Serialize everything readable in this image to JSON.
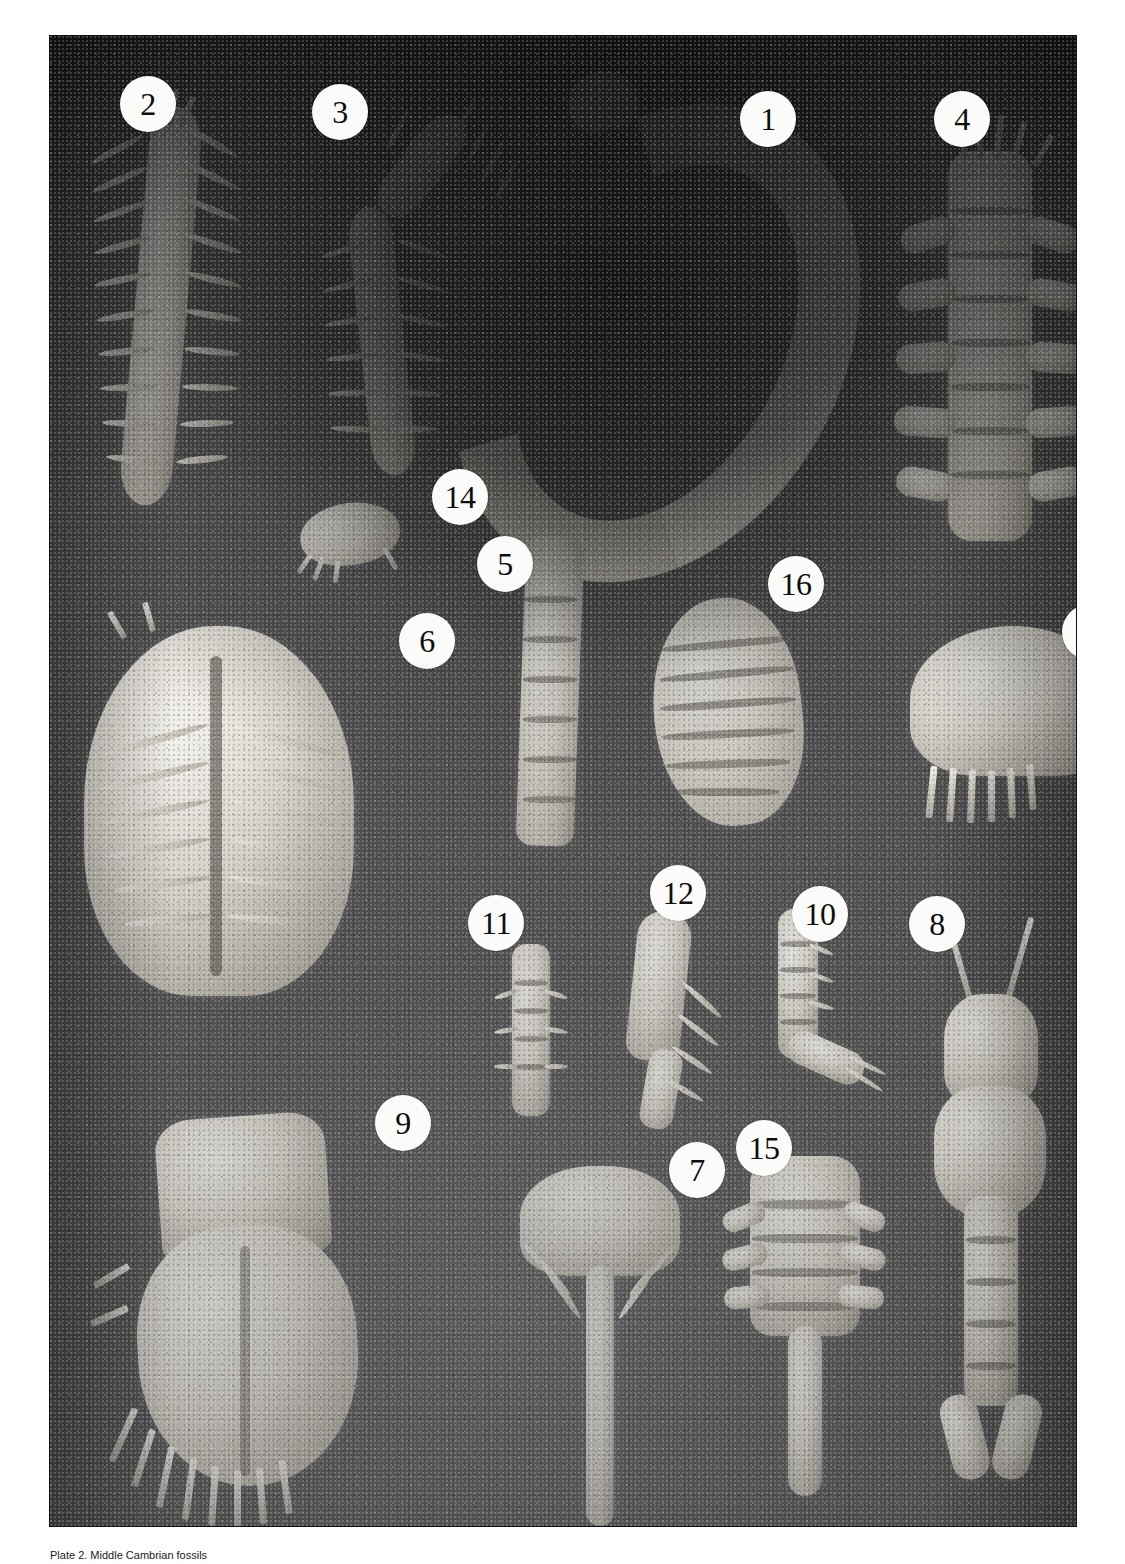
{
  "plate": {
    "title": "Middle Cambrian Burgess Shale fossil plate",
    "background_color": "#4f4f4f",
    "dark_field_color": "#1c1c1c",
    "callout_fill": "#fbfbf9",
    "callout_text_color": "#0d0d0d",
    "callouts": [
      {
        "id": "callout-2",
        "label": "2",
        "x": 70,
        "y": 40
      },
      {
        "id": "callout-3",
        "label": "3",
        "x": 262,
        "y": 48
      },
      {
        "id": "callout-1",
        "label": "1",
        "x": 690,
        "y": 55
      },
      {
        "id": "callout-4",
        "label": "4",
        "x": 884,
        "y": 55
      },
      {
        "id": "callout-14",
        "label": "14",
        "x": 382,
        "y": 433
      },
      {
        "id": "callout-5",
        "label": "5",
        "x": 427,
        "y": 500
      },
      {
        "id": "callout-16",
        "label": "16",
        "x": 718,
        "y": 520
      },
      {
        "id": "callout-6",
        "label": "6",
        "x": 349,
        "y": 577
      },
      {
        "id": "callout-13",
        "label": "13",
        "x": 1012,
        "y": 568
      },
      {
        "id": "callout-11",
        "label": "11",
        "x": 418,
        "y": 859
      },
      {
        "id": "callout-12",
        "label": "12",
        "x": 600,
        "y": 829
      },
      {
        "id": "callout-10",
        "label": "10",
        "x": 742,
        "y": 850
      },
      {
        "id": "callout-8",
        "label": "8",
        "x": 859,
        "y": 860
      },
      {
        "id": "callout-9",
        "label": "9",
        "x": 325,
        "y": 1059
      },
      {
        "id": "callout-7",
        "label": "7",
        "x": 619,
        "y": 1106
      },
      {
        "id": "callout-15",
        "label": "15",
        "x": 686,
        "y": 1084
      }
    ]
  },
  "caption": {
    "text": "Plate 2.  Middle Cambrian fossils"
  }
}
